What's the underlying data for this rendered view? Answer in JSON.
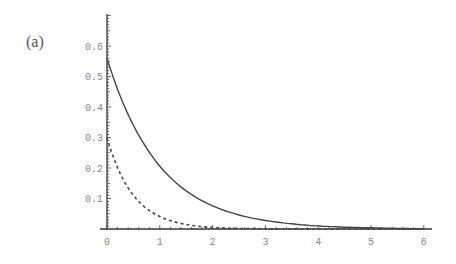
{
  "panel_label": "(a)",
  "chart_data": {
    "type": "line",
    "title": "",
    "xlabel": "",
    "ylabel": "",
    "xlim": [
      0,
      6.15
    ],
    "ylim": [
      0,
      0.7
    ],
    "grid": false,
    "legend": null,
    "x_ticks": [
      0,
      1,
      2,
      3,
      4,
      5,
      6
    ],
    "x_tick_labels": [
      "0",
      "1",
      "2",
      "3",
      "4",
      "5",
      "6"
    ],
    "y_ticks": [
      0.1,
      0.2,
      0.3,
      0.4,
      0.5,
      0.6
    ],
    "y_tick_labels": [
      "0.1",
      "0.2",
      "0.3",
      "0.4",
      "0.5",
      "0.6"
    ],
    "series": [
      {
        "name": "solid",
        "style": "solid",
        "color": "#444444",
        "x": [
          0,
          0.25,
          0.5,
          0.75,
          1,
          1.5,
          2,
          2.5,
          3,
          3.5,
          4,
          4.5,
          5,
          5.5,
          6
        ],
        "values": [
          0.56,
          0.436,
          0.34,
          0.265,
          0.206,
          0.125,
          0.076,
          0.046,
          0.028,
          0.017,
          0.01,
          0.006,
          0.004,
          0.002,
          0.001
        ]
      },
      {
        "name": "dashed",
        "style": "dashed",
        "color": "#444444",
        "x": [
          0,
          0.25,
          0.5,
          0.75,
          1,
          1.5,
          2,
          2.5,
          3,
          3.5,
          4,
          4.5,
          5,
          5.5,
          6
        ],
        "values": [
          0.3,
          0.182,
          0.11,
          0.067,
          0.041,
          0.015,
          0.005,
          0.002,
          0.001,
          0.0,
          0.0,
          0.0,
          0.0,
          0.0,
          0.0
        ]
      }
    ]
  }
}
